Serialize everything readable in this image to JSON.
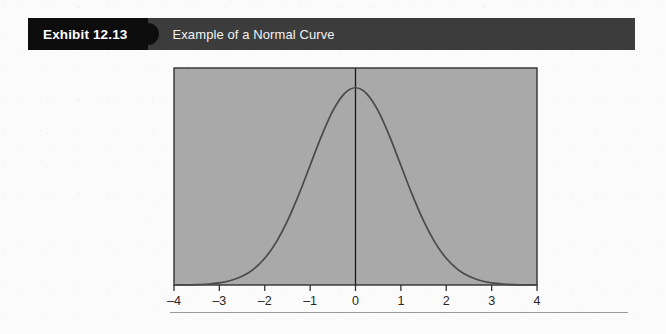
{
  "header": {
    "exhibit_number": "Exhibit 12.13",
    "title": "Example of a Normal Curve",
    "tab_color": "#0d0d0d",
    "bar_color": "#3c3c3c",
    "text_color": "#ffffff"
  },
  "page": {
    "background_color": "#fbfbfb"
  },
  "footer": {
    "rule_color": "#9a9a9a"
  },
  "chart_data": {
    "type": "line",
    "title": "Example of a Normal Curve",
    "xlabel": "",
    "ylabel": "",
    "x_tick_labels": [
      "–4",
      "–3",
      "–2",
      "–1",
      "0",
      "1",
      "2",
      "3",
      "4"
    ],
    "x_tick_values": [
      -4,
      -3,
      -2,
      -1,
      0,
      1,
      2,
      3,
      4
    ],
    "xlim": [
      -4,
      4
    ],
    "ylim": [
      0,
      1.1
    ],
    "grid": false,
    "legend": "none",
    "plot_background_color": "#a9a9a9",
    "plot_border_color": "#333333",
    "curve_color": "#4a4a4a",
    "center_line_color": "#1a1a1a",
    "center_line_x": 0,
    "axis_label_color": "#262626",
    "distribution": "standard normal (mean 0, sd 1)",
    "series": [
      {
        "name": "Normal curve",
        "x": [
          -4,
          -3.75,
          -3.5,
          -3.25,
          -3,
          -2.75,
          -2.5,
          -2.25,
          -2,
          -1.75,
          -1.5,
          -1.25,
          -1,
          -0.75,
          -0.5,
          -0.25,
          0,
          0.25,
          0.5,
          0.75,
          1,
          1.25,
          1.5,
          1.75,
          2,
          2.25,
          2.5,
          2.75,
          3,
          3.25,
          3.5,
          3.75,
          4
        ],
        "y": [
          0.0003,
          0.0009,
          0.0022,
          0.0051,
          0.0111,
          0.0228,
          0.0439,
          0.0796,
          0.1353,
          0.2163,
          0.3247,
          0.4578,
          0.6065,
          0.7548,
          0.8825,
          0.9692,
          1.0,
          0.9692,
          0.8825,
          0.7548,
          0.6065,
          0.4578,
          0.3247,
          0.2163,
          0.1353,
          0.0796,
          0.0439,
          0.0228,
          0.0111,
          0.0051,
          0.0022,
          0.0009,
          0.0003
        ]
      }
    ]
  }
}
